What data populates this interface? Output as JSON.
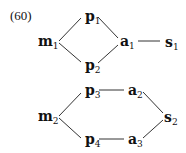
{
  "example_number": "(60)",
  "diagram1": {
    "nodes": [
      {
        "id": "m1",
        "base": "m",
        "sub": "1"
      },
      {
        "id": "p1",
        "base": "p",
        "sub": "1"
      },
      {
        "id": "p2",
        "base": "p",
        "sub": "2"
      },
      {
        "id": "a1",
        "base": "a",
        "sub": "1"
      },
      {
        "id": "s1",
        "base": "s",
        "sub": "1"
      }
    ],
    "edges": [
      [
        "m1",
        "p1"
      ],
      [
        "m1",
        "p2"
      ],
      [
        "p1",
        "a1"
      ],
      [
        "p2",
        "a1"
      ],
      [
        "a1",
        "s1"
      ]
    ]
  },
  "diagram2": {
    "nodes": [
      {
        "id": "m2",
        "base": "m",
        "sub": "2"
      },
      {
        "id": "p3",
        "base": "p",
        "sub": "3"
      },
      {
        "id": "p4",
        "base": "p",
        "sub": "4"
      },
      {
        "id": "a2",
        "base": "a",
        "sub": "2"
      },
      {
        "id": "a3",
        "base": "a",
        "sub": "3"
      },
      {
        "id": "s2",
        "base": "s",
        "sub": "2"
      }
    ],
    "edges": [
      [
        "m2",
        "p3"
      ],
      [
        "m2",
        "p4"
      ],
      [
        "p3",
        "a2"
      ],
      [
        "p4",
        "a3"
      ],
      [
        "a2",
        "s2"
      ],
      [
        "a3",
        "s2"
      ]
    ]
  }
}
